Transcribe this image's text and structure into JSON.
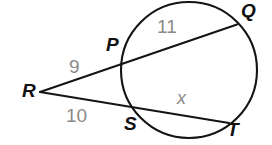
{
  "figure": {
    "kind": "circle-secants-geometry-diagram",
    "background_color": "#ffffff",
    "stroke_color": "#141414",
    "point_label_color": "#111111",
    "measure_label_color": "#8a8a8a",
    "width": 272,
    "height": 145
  },
  "circle": {
    "center_x": 189,
    "center_y": 70,
    "radius": 68
  },
  "points": [
    {
      "id": "Q",
      "label": "Q",
      "x": 236,
      "y": 25,
      "label_x": 241,
      "label_y": 1
    },
    {
      "id": "P",
      "label": "P",
      "x": 126,
      "y": 61,
      "label_x": 106,
      "label_y": 35
    },
    {
      "id": "R",
      "label": "R",
      "x": 40,
      "y": 92,
      "label_x": 22,
      "label_y": 81
    },
    {
      "id": "S",
      "label": "S",
      "x": 135,
      "y": 112,
      "label_x": 124,
      "label_y": 114
    },
    {
      "id": "T",
      "label": "T",
      "x": 226,
      "y": 122,
      "label_x": 227,
      "label_y": 120
    }
  ],
  "segments": [
    {
      "id": "RQ",
      "from": "R",
      "to": "Q",
      "description": "secant through P and Q"
    },
    {
      "id": "RT",
      "from": "R",
      "to": "T",
      "description": "secant through S and T"
    }
  ],
  "measures": [
    {
      "id": "RP",
      "text": "9",
      "x": 69,
      "y": 57,
      "style": "measure"
    },
    {
      "id": "PQ",
      "text": "11",
      "x": 157,
      "y": 17,
      "style": "measure"
    },
    {
      "id": "RS",
      "text": "10",
      "x": 66,
      "y": 106,
      "style": "measure"
    },
    {
      "id": "ST",
      "text": "x",
      "x": 177,
      "y": 89,
      "style": "variable"
    }
  ]
}
